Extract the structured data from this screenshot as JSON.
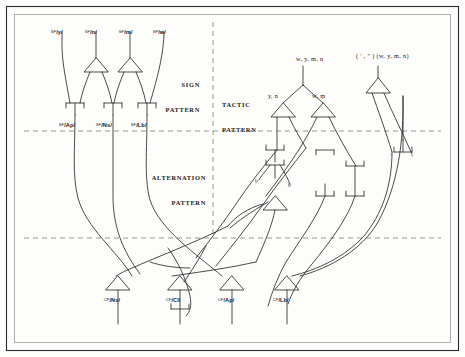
{
  "figure": {
    "type": "linguistic-stratificational-network-diagram",
    "frame": {
      "stroke": "#2b2b2b",
      "inner_stroke": "#777777",
      "background": "#fdfdfb"
    },
    "line_color": "#2b2b2b",
    "divider_color": "#8a8a8a"
  },
  "sections": [
    {
      "id": "sign-pattern",
      "line1": "SIGN",
      "line2": "PATTERN",
      "x": 185,
      "y": 70,
      "align": "right"
    },
    {
      "id": "alternation-pattern",
      "line1": "ALTERNATION",
      "line2": "PATTERN",
      "x": 163,
      "y": 157,
      "align": "right"
    },
    {
      "id": "tactic-pattern",
      "line1": "TACTIC",
      "line2": "PATTERN",
      "x": 231,
      "y": 84,
      "align": "left"
    }
  ],
  "sign_inputs": [
    {
      "id": "sf-y",
      "prefix": "SF",
      "body": "/y/",
      "x": 50,
      "y": 27
    },
    {
      "id": "sf-n",
      "prefix": "SF",
      "body": "/n/",
      "x": 85,
      "y": 27
    },
    {
      "id": "sf-m",
      "prefix": "SF",
      "body": "/m/",
      "x": 119,
      "y": 27
    },
    {
      "id": "sf-w",
      "prefix": "SF",
      "body": "/w/",
      "x": 153,
      "y": 27
    }
  ],
  "sign_outputs": [
    {
      "id": "sf-ap",
      "prefix": "SF",
      "body": "/Ap/",
      "x": 59,
      "y": 117
    },
    {
      "id": "sf-ns",
      "prefix": "SF",
      "body": "/Ns/",
      "x": 95,
      "y": 117
    },
    {
      "id": "sf-lb",
      "prefix": "SF",
      "body": "/Lb/",
      "x": 130,
      "y": 117
    }
  ],
  "conceptual_outputs": [
    {
      "id": "cf-ns",
      "prefix": "CF",
      "body": "/Ns/",
      "x": 106,
      "y": 292
    },
    {
      "id": "cf-cl",
      "prefix": "CF",
      "body": "/Cl/",
      "x": 166,
      "y": 292
    },
    {
      "id": "cf-ap",
      "prefix": "CF",
      "body": "/Ap/",
      "x": 218,
      "y": 292
    },
    {
      "id": "cf-lb",
      "prefix": "CF",
      "body": "/Lb/",
      "x": 273,
      "y": 292
    }
  ],
  "tactic_labels": [
    {
      "id": "tactic-top-left",
      "text": "w, y, m, n",
      "x": 295,
      "y": 60
    },
    {
      "id": "tactic-top-right",
      "text": "( ' , \" ) (w, y, m, n)",
      "x": 357,
      "y": 57
    },
    {
      "id": "tactic-yn",
      "text": "y, n",
      "x": 271,
      "y": 95
    },
    {
      "id": "tactic-wm",
      "text": "w, m",
      "x": 315,
      "y": 95
    }
  ],
  "small_marks": [
    {
      "id": "mark-b-left",
      "text": "b",
      "x": 258,
      "y": 182
    },
    {
      "id": "mark-b-right",
      "text": "b",
      "x": 290,
      "y": 186
    },
    {
      "id": "mark-prime",
      "text": "'",
      "x": 393,
      "y": 157
    },
    {
      "id": "mark-dprime",
      "text": "\"",
      "x": 414,
      "y": 159
    }
  ],
  "dividers": {
    "vertical_x": 213,
    "horizontal_upper_y": 131,
    "horizontal_lower_y": 238
  }
}
